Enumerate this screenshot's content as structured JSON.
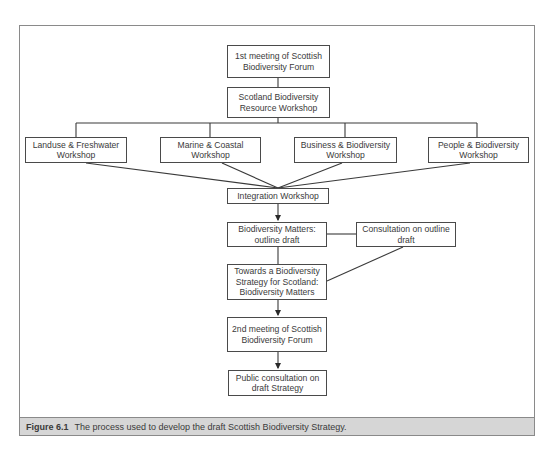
{
  "diagram": {
    "type": "flowchart",
    "nodes": {
      "forum1": "1st meeting of Scottish Biodiversity Forum",
      "resource": "Scotland Biodiversity Resource Workshop",
      "landuse": "Landuse & Freshwater Workshop",
      "marine": "Marine & Coastal Workshop",
      "business": "Business & Biodiversity Workshop",
      "people": "People & Biodiversity Workshop",
      "integration": "Integration Workshop",
      "matters": "Biodiversity Matters: outline draft",
      "consultation": "Consultation on outline draft",
      "towards": "Towards a Biodiversity Strategy for Scotland: Biodiversity Matters",
      "forum2": "2nd meeting of Scottish Biodiversity Forum",
      "public": "Public consultation on draft Strategy"
    },
    "edges": [
      [
        "forum1",
        "resource"
      ],
      [
        "resource",
        "landuse"
      ],
      [
        "resource",
        "marine"
      ],
      [
        "resource",
        "business"
      ],
      [
        "resource",
        "people"
      ],
      [
        "landuse",
        "integration"
      ],
      [
        "marine",
        "integration"
      ],
      [
        "business",
        "integration"
      ],
      [
        "people",
        "integration"
      ],
      [
        "integration",
        "matters"
      ],
      [
        "matters",
        "consultation"
      ],
      [
        "matters",
        "towards"
      ],
      [
        "consultation",
        "towards"
      ],
      [
        "towards",
        "forum2"
      ],
      [
        "forum2",
        "public"
      ]
    ]
  },
  "caption": {
    "label": "Figure 6.1",
    "text": "The process used to develop the draft Scottish Biodiversity Strategy."
  }
}
